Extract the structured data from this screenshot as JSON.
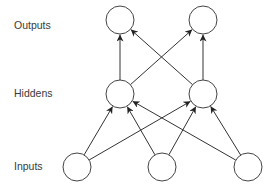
{
  "diagram": {
    "type": "neural-network",
    "layers": [
      {
        "id": "outputs",
        "label": "Outputs",
        "label_pos": [
          14,
          29
        ],
        "nodes": [
          [
            120,
            20
          ],
          [
            203,
            20
          ]
        ]
      },
      {
        "id": "hiddens",
        "label": "Hiddens",
        "label_pos": [
          14,
          97
        ],
        "nodes": [
          [
            120,
            94
          ],
          [
            203,
            94
          ]
        ]
      },
      {
        "id": "inputs",
        "label": "Inputs",
        "label_pos": [
          14,
          170
        ],
        "nodes": [
          [
            77,
            167
          ],
          [
            162,
            167
          ],
          [
            248,
            167
          ]
        ]
      }
    ],
    "node_radius": 14,
    "connections": [
      {
        "from": "inputs",
        "to": "hiddens",
        "pattern": "fully-connected"
      },
      {
        "from": "hiddens",
        "to": "outputs",
        "pattern": "fully-connected"
      }
    ],
    "colors": {
      "stroke": "#333333",
      "node_fill": "#ffffff",
      "label": "#3a3a3a"
    }
  }
}
